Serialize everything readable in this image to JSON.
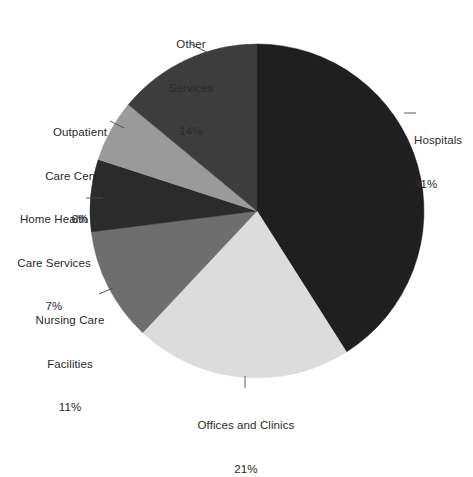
{
  "chart_data": {
    "type": "pie",
    "title": "",
    "subtitle": "",
    "xlabel": "",
    "ylabel": "",
    "legend_position": "none",
    "grid": false,
    "label_format": "name + percent",
    "start_angle_deg": 0,
    "direction": "clockwise",
    "categories": [
      "Hospitals",
      "Offices and Clinics",
      "Nursing Care Facilities",
      "Home Health Care Services",
      "Outpatient Care Centers",
      "Other Services"
    ],
    "values": [
      41,
      21,
      11,
      7,
      6,
      14
    ],
    "units": "%",
    "slices": [
      {
        "name": "Hospitals",
        "label_line_1": "Hospitals",
        "label_line_2": "",
        "percent": 41,
        "percent_text": "41%",
        "color": "#1f1f1f",
        "label_align": "left"
      },
      {
        "name": "Offices and Clinics",
        "label_line_1": "Offices and Clinics",
        "label_line_2": "",
        "percent": 21,
        "percent_text": "21%",
        "color": "#dcdcdc",
        "label_align": "center"
      },
      {
        "name": "Nursing Care Facilities",
        "label_line_1": "Nursing Care",
        "label_line_2": "Facilities",
        "percent": 11,
        "percent_text": "11%",
        "color": "#6e6e6e",
        "label_align": "center"
      },
      {
        "name": "Home Health Care Services",
        "label_line_1": "Home Health",
        "label_line_2": "Care Services",
        "percent": 7,
        "percent_text": "7%",
        "color": "#2b2b2b",
        "label_align": "center"
      },
      {
        "name": "Outpatient Care Centers",
        "label_line_1": "Outpatient",
        "label_line_2": "Care Centers",
        "percent": 6,
        "percent_text": "6%",
        "color": "#9a9a9a",
        "label_align": "center"
      },
      {
        "name": "Other Services",
        "label_line_1": "Other",
        "label_line_2": "Services",
        "percent": 14,
        "percent_text": "14%",
        "color": "#3d3d3d",
        "label_align": "center"
      }
    ]
  },
  "labels": {
    "hospitals": {
      "line1": "Hospitals",
      "line2": "",
      "pct": "41%"
    },
    "offices": {
      "line1": "Offices and Clinics",
      "line2": "",
      "pct": "21%"
    },
    "nursing": {
      "line1": "Nursing Care",
      "line2": "Facilities",
      "pct": "11%"
    },
    "home_health": {
      "line1": "Home Health",
      "line2": "Care Services",
      "pct": "7%"
    },
    "outpatient": {
      "line1": "Outpatient",
      "line2": "Care Centers",
      "pct": "6%"
    },
    "other": {
      "line1": "Other",
      "line2": "Services",
      "pct": "14%"
    }
  }
}
